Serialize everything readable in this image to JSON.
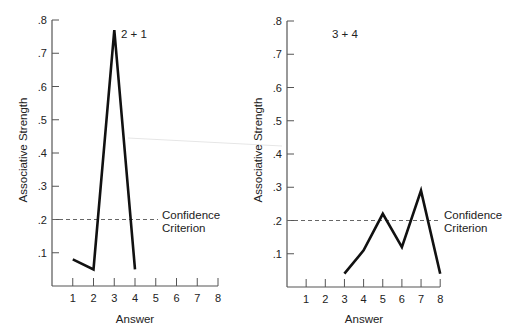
{
  "chart_data": [
    {
      "type": "line",
      "title": "2 + 1",
      "xlabel": "Answer",
      "ylabel": "Associative Strength",
      "x": [
        1,
        2,
        3,
        4
      ],
      "values": [
        0.08,
        0.05,
        0.77,
        0.05
      ],
      "x_ticks": [
        "1",
        "2",
        "3",
        "4",
        "5",
        "6",
        "7",
        "8"
      ],
      "y_ticks": [
        ".1",
        ".2",
        ".3",
        ".4",
        ".5",
        ".6",
        ".7",
        ".8"
      ],
      "xlim": [
        0,
        8
      ],
      "ylim": [
        0,
        0.8
      ],
      "grid": false,
      "annotations": [
        {
          "type": "hline",
          "y": 0.2,
          "style": "dashed",
          "label": "Confidence Criterion"
        }
      ]
    },
    {
      "type": "line",
      "title": "3 + 4",
      "xlabel": "Answer",
      "ylabel": "Associative Strength",
      "x": [
        3,
        4,
        5,
        6,
        7,
        8
      ],
      "values": [
        0.04,
        0.11,
        0.22,
        0.12,
        0.29,
        0.04
      ],
      "x_ticks": [
        "1",
        "2",
        "3",
        "4",
        "5",
        "6",
        "7",
        "8"
      ],
      "y_ticks": [
        ".1",
        ".2",
        ".3",
        ".4",
        ".5",
        ".6",
        ".7",
        ".8"
      ],
      "xlim": [
        0,
        8
      ],
      "ylim": [
        0,
        0.8
      ],
      "grid": false,
      "annotations": [
        {
          "type": "hline",
          "y": 0.2,
          "style": "dashed",
          "label": "Confidence Criterion"
        }
      ]
    }
  ],
  "panels": [
    {
      "label": "2 + 1",
      "xlabel": "Answer",
      "ylabel": "Associative Strength",
      "criterion_line1": "Confidence",
      "criterion_line2": "Criterion"
    },
    {
      "label": "3 + 4",
      "xlabel": "Answer",
      "ylabel": "Associative Strength",
      "criterion_line1": "Confidence",
      "criterion_line2": "Criterion"
    }
  ],
  "colors": {
    "data_line": "#111111",
    "axis": "#555555",
    "criterion": "#666666"
  }
}
